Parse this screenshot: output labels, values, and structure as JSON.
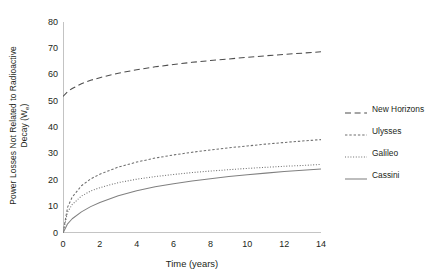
{
  "chart_data": {
    "type": "line",
    "title": "",
    "xlabel": "Time (years)",
    "ylabel_line1": "Power Losses Not Related to Radioactive",
    "ylabel_line2_pre": "Decay (W",
    "ylabel_line2_sub": "e",
    "ylabel_line2_post": ")",
    "xlim": [
      0,
      14
    ],
    "ylim": [
      0,
      80
    ],
    "grid": false,
    "legend_position": "right-outside",
    "xticks": [
      0,
      2,
      4,
      6,
      8,
      10,
      12,
      14
    ],
    "xtick_labels": [
      "0",
      "2",
      "4",
      "6",
      "8",
      "10",
      "12",
      "14"
    ],
    "yticks": [
      0,
      10,
      20,
      30,
      40,
      50,
      60,
      70,
      80
    ],
    "ytick_labels": [
      "0",
      "10",
      "20",
      "30",
      "40",
      "50",
      "60",
      "70",
      "80"
    ],
    "x": [
      0,
      0.25,
      0.5,
      1,
      1.5,
      2,
      3,
      4,
      5,
      6,
      7,
      8,
      9,
      10,
      11,
      12,
      13,
      14
    ],
    "series": [
      {
        "name": "New Horizons",
        "style": "dashed-long",
        "color": "#4d4d4d",
        "values": [
          51.8,
          53.6,
          54.8,
          56.6,
          57.9,
          58.9,
          60.6,
          61.9,
          63.0,
          63.9,
          64.7,
          65.4,
          66.0,
          66.6,
          67.2,
          67.7,
          68.2,
          68.7
        ]
      },
      {
        "name": "Ulysses",
        "style": "dashed-medium",
        "color": "#6e6e6e",
        "values": [
          0.0,
          9.8,
          13.6,
          17.9,
          20.5,
          22.3,
          25.0,
          26.9,
          28.4,
          29.6,
          30.6,
          31.5,
          32.3,
          33.0,
          33.7,
          34.3,
          34.9,
          35.4
        ]
      },
      {
        "name": "Galileo",
        "style": "dotted",
        "color": "#6e6e6e",
        "values": [
          0.0,
          8.0,
          10.8,
          14.0,
          15.9,
          17.2,
          19.1,
          20.4,
          21.4,
          22.2,
          22.9,
          23.5,
          24.0,
          24.5,
          24.9,
          25.3,
          25.6,
          26.0
        ]
      },
      {
        "name": "Cassini",
        "style": "solid",
        "color": "#808080",
        "values": [
          0.0,
          3.5,
          5.4,
          8.0,
          10.0,
          11.6,
          14.1,
          16.0,
          17.5,
          18.7,
          19.7,
          20.6,
          21.4,
          22.1,
          22.7,
          23.3,
          23.8,
          24.3
        ]
      }
    ]
  }
}
